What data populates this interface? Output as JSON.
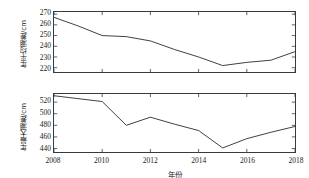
{
  "figure": {
    "background": "#ffffff",
    "line_color": "#2b2b2b",
    "axis_color": "#3a3a3a"
  },
  "xaxis": {
    "label": "年份",
    "ticks": [
      "2008",
      "2010",
      "2012",
      "2014",
      "2016",
      "2018"
    ],
    "min": 2008,
    "max": 2018
  },
  "panels": {
    "top": {
      "ylabel": "年平均潮差/cm",
      "yticks": [
        "270",
        "260",
        "250",
        "240",
        "230",
        "220"
      ]
    },
    "bottom": {
      "ylabel": "年最大潮差/cm",
      "yticks": [
        "520",
        "500",
        "480",
        "460",
        "440"
      ]
    }
  },
  "chart_data": [
    {
      "type": "line",
      "title": "",
      "panel": "top",
      "xlabel": "年份",
      "ylabel": "年平均潮差/cm",
      "x": [
        2008,
        2009,
        2010,
        2011,
        2012,
        2013,
        2014,
        2015,
        2016,
        2017,
        2018
      ],
      "values": [
        267,
        259,
        250,
        249,
        245,
        237,
        230,
        222,
        225,
        227,
        235
      ],
      "xlim": [
        2008,
        2018
      ],
      "ylim": [
        216,
        272
      ],
      "ytick_values": [
        270,
        260,
        250,
        240,
        230,
        220
      ],
      "xtick_values": [
        2008,
        2010,
        2012,
        2014,
        2016,
        2018
      ],
      "grid": false,
      "legend": null,
      "series_name": "年平均潮差"
    },
    {
      "type": "line",
      "title": "",
      "panel": "bottom",
      "xlabel": "年份",
      "ylabel": "年最大潮差/cm",
      "x": [
        2008,
        2009,
        2010,
        2011,
        2012,
        2013,
        2014,
        2015,
        2016,
        2017,
        2018
      ],
      "values": [
        531,
        526,
        521,
        480,
        494,
        482,
        471,
        441,
        457,
        468,
        478
      ],
      "xlim": [
        2008,
        2018
      ],
      "ylim": [
        434,
        534
      ],
      "ytick_values": [
        520,
        500,
        480,
        460,
        440
      ],
      "xtick_values": [
        2008,
        2010,
        2012,
        2014,
        2016,
        2018
      ],
      "grid": false,
      "legend": null,
      "series_name": "年最大潮差"
    }
  ]
}
